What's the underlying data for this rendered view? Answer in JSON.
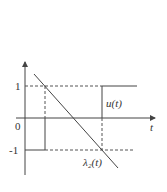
{
  "diagram": {
    "axes": {
      "x_label": "t",
      "origin_label": "0",
      "y_tick_top": "1",
      "y_tick_bottom": "-1"
    },
    "curves": [
      {
        "name": "u(t)",
        "label": "u(t)",
        "style": "solid",
        "description": "bang-bang control: -1 then switches to 1"
      },
      {
        "name": "lambda2(t)",
        "label": "λ₂(t)",
        "style": "solid",
        "description": "decreasing linear costate"
      }
    ],
    "guides": {
      "style": "dashed",
      "levels": [
        "1",
        "-1"
      ]
    },
    "colors": {
      "line": "#444444",
      "text": "#333333",
      "background": "#ffffff"
    }
  }
}
